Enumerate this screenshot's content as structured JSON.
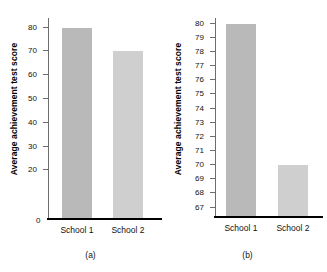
{
  "figure": {
    "background": "#ffffff",
    "bar_colors": [
      "#b9b9b9",
      "#cfcfcf"
    ],
    "axis_color": "#6e6e6e",
    "baseline_color": "#000000"
  },
  "panels": [
    {
      "id": "a",
      "caption": "(a)",
      "ylabel": "Average achievement test score",
      "zero_label": "0",
      "categories": [
        "School 1",
        "School 2"
      ],
      "yticks": [
        20,
        30,
        40,
        50,
        60,
        70,
        80
      ]
    },
    {
      "id": "b",
      "caption": "(b)",
      "ylabel": "Average achievement test score",
      "categories": [
        "School 1",
        "School 2"
      ],
      "yticks": [
        67,
        68,
        69,
        70,
        71,
        72,
        73,
        74,
        75,
        76,
        77,
        78,
        79,
        80
      ]
    }
  ],
  "chart_data": [
    {
      "type": "bar",
      "title": "(a)",
      "xlabel": "",
      "ylabel": "Average achievement test score",
      "categories": [
        "School 1",
        "School 2"
      ],
      "values": [
        80,
        70
      ],
      "ylim": [
        0,
        84
      ],
      "ytick_values": [
        20,
        30,
        40,
        50,
        60,
        70,
        80
      ],
      "ytick_labels": [
        "20",
        "30",
        "40",
        "50",
        "60",
        "70",
        "80"
      ],
      "axis_origin_label": "0",
      "grid": false,
      "legend": null,
      "bar_colors": [
        "#b9b9b9",
        "#cfcfcf"
      ],
      "note": "Full-scale y axis starting at zero; difference between schools appears modest."
    },
    {
      "type": "bar",
      "title": "(b)",
      "xlabel": "",
      "ylabel": "Average achievement test score",
      "categories": [
        "School 1",
        "School 2"
      ],
      "values": [
        80,
        70
      ],
      "ylim": [
        66.4,
        80.4
      ],
      "ytick_values": [
        67,
        68,
        69,
        70,
        71,
        72,
        73,
        74,
        75,
        76,
        77,
        78,
        79,
        80
      ],
      "ytick_labels": [
        "67",
        "68",
        "69",
        "70",
        "71",
        "72",
        "73",
        "74",
        "75",
        "76",
        "77",
        "78",
        "79",
        "80"
      ],
      "grid": false,
      "legend": null,
      "bar_colors": [
        "#b9b9b9",
        "#cfcfcf"
      ],
      "note": "Truncated y axis starting near 67; same data appears to show a far larger difference."
    }
  ]
}
